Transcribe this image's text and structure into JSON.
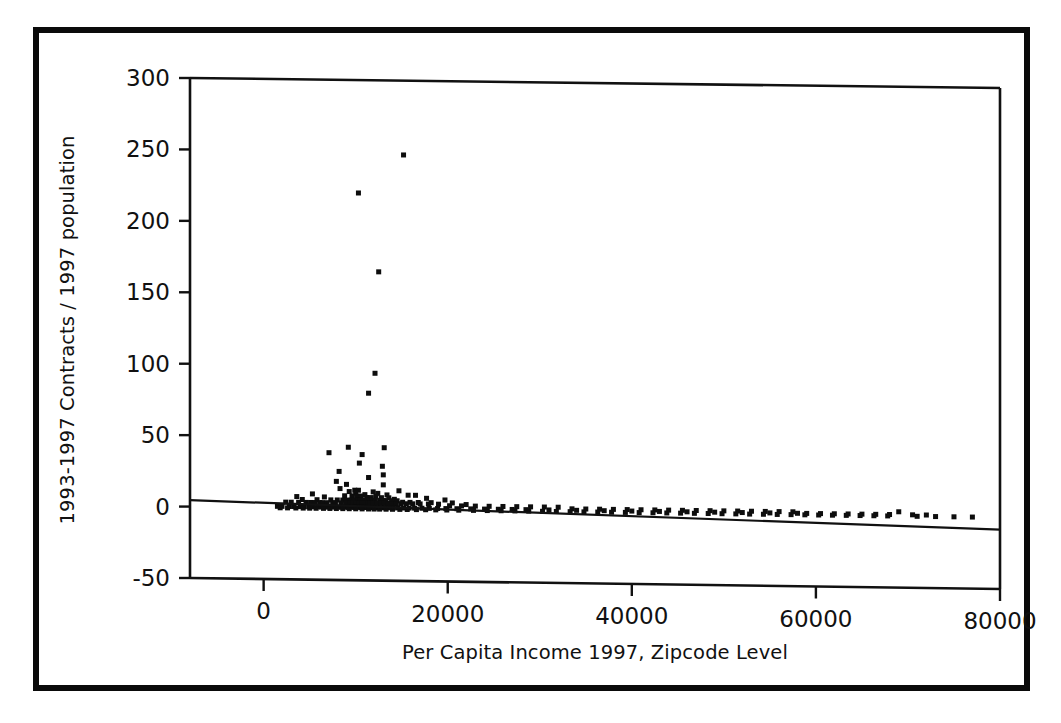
{
  "figure": {
    "name": "scatter-plot-figure",
    "background_color": "#ffffff",
    "frame_color": "#0a0a0a",
    "marker_color": "#0d0d0d"
  },
  "chart_data": {
    "type": "scatter",
    "title": "",
    "xlabel": "Per Capita Income 1997, Zipcode Level",
    "ylabel": "1993-1997 Contracts / 1997 population",
    "xlim": [
      -8000,
      80000
    ],
    "ylim": [
      -50,
      300
    ],
    "xticks": [
      0,
      20000,
      40000,
      60000,
      80000
    ],
    "xtick_labels": [
      "0",
      "20000",
      "40000",
      "60000",
      "80000"
    ],
    "yticks": [
      -50,
      0,
      50,
      100,
      150,
      200,
      250,
      300
    ],
    "ytick_labels": [
      "-50",
      "0",
      "50",
      "100",
      "150",
      "200",
      "250",
      "300"
    ],
    "grid": false,
    "legend": null,
    "series": [
      {
        "name": "Zipcode observations",
        "marker": "square",
        "marker_size": 5,
        "points": [
          [
            15200,
            248
          ],
          [
            10300,
            221
          ],
          [
            12500,
            166
          ],
          [
            12100,
            95
          ],
          [
            11400,
            81
          ],
          [
            13100,
            43
          ],
          [
            9200,
            43
          ],
          [
            7100,
            39
          ],
          [
            10700,
            38
          ],
          [
            10400,
            32
          ],
          [
            12900,
            30
          ],
          [
            8200,
            26
          ],
          [
            13000,
            24
          ],
          [
            11400,
            22
          ],
          [
            7900,
            19
          ],
          [
            9000,
            17
          ],
          [
            13000,
            17
          ],
          [
            8300,
            14
          ],
          [
            9900,
            13
          ],
          [
            10300,
            13
          ],
          [
            14700,
            13
          ],
          [
            9300,
            12
          ],
          [
            11900,
            12
          ],
          [
            12400,
            11
          ],
          [
            10000,
            11
          ],
          [
            5300,
            10
          ],
          [
            11000,
            10
          ],
          [
            13400,
            10
          ],
          [
            15700,
            10
          ],
          [
            16500,
            10
          ],
          [
            3600,
            8
          ],
          [
            6600,
            8
          ],
          [
            8800,
            9
          ],
          [
            9600,
            9
          ],
          [
            10100,
            9
          ],
          [
            10600,
            9
          ],
          [
            11200,
            8
          ],
          [
            11700,
            8
          ],
          [
            12200,
            9
          ],
          [
            12800,
            8
          ],
          [
            13600,
            8
          ],
          [
            14200,
            7
          ],
          [
            17700,
            8
          ],
          [
            19700,
            7
          ],
          [
            4200,
            6
          ],
          [
            5800,
            6
          ],
          [
            7300,
            6
          ],
          [
            8000,
            6
          ],
          [
            8600,
            6
          ],
          [
            9100,
            6
          ],
          [
            9500,
            6
          ],
          [
            9800,
            6
          ],
          [
            10200,
            6
          ],
          [
            10500,
            6
          ],
          [
            10800,
            6
          ],
          [
            11100,
            6
          ],
          [
            11500,
            6
          ],
          [
            11800,
            6
          ],
          [
            12100,
            6
          ],
          [
            12600,
            6
          ],
          [
            13000,
            6
          ],
          [
            13300,
            6
          ],
          [
            13900,
            6
          ],
          [
            14500,
            6
          ],
          [
            15100,
            5
          ],
          [
            15900,
            5
          ],
          [
            16800,
            5
          ],
          [
            18200,
            5
          ],
          [
            20500,
            5
          ],
          [
            22000,
            4
          ],
          [
            2400,
            4
          ],
          [
            3000,
            4
          ],
          [
            3800,
            4
          ],
          [
            4600,
            4
          ],
          [
            5100,
            4
          ],
          [
            5600,
            4
          ],
          [
            6100,
            4
          ],
          [
            6400,
            4
          ],
          [
            6900,
            4
          ],
          [
            7500,
            4
          ],
          [
            7800,
            4
          ],
          [
            8400,
            4
          ],
          [
            8900,
            4
          ],
          [
            9400,
            4
          ],
          [
            9700,
            4
          ],
          [
            10000,
            4
          ],
          [
            10400,
            4
          ],
          [
            10700,
            4
          ],
          [
            11000,
            4
          ],
          [
            11300,
            4
          ],
          [
            11600,
            4
          ],
          [
            11900,
            4
          ],
          [
            12300,
            4
          ],
          [
            12700,
            4
          ],
          [
            13100,
            4
          ],
          [
            13500,
            4
          ],
          [
            14000,
            4
          ],
          [
            14400,
            4
          ],
          [
            14900,
            4
          ],
          [
            15500,
            4
          ],
          [
            16200,
            4
          ],
          [
            17000,
            4
          ],
          [
            17900,
            4
          ],
          [
            19000,
            4
          ],
          [
            20200,
            3
          ],
          [
            21500,
            3
          ],
          [
            23000,
            3
          ],
          [
            24500,
            3
          ],
          [
            26000,
            3
          ],
          [
            27500,
            3
          ],
          [
            29000,
            3
          ],
          [
            30500,
            3
          ],
          [
            32000,
            3
          ],
          [
            33500,
            2
          ],
          [
            35000,
            2
          ],
          [
            36500,
            2
          ],
          [
            38000,
            2
          ],
          [
            39500,
            2
          ],
          [
            41000,
            2
          ],
          [
            42500,
            2
          ],
          [
            44000,
            2
          ],
          [
            45500,
            2
          ],
          [
            47000,
            2
          ],
          [
            48500,
            2
          ],
          [
            50000,
            2
          ],
          [
            51500,
            2
          ],
          [
            53000,
            2
          ],
          [
            54500,
            2
          ],
          [
            56000,
            2
          ],
          [
            57500,
            2
          ],
          [
            59000,
            1
          ],
          [
            60500,
            1
          ],
          [
            62000,
            1
          ],
          [
            63500,
            1
          ],
          [
            65000,
            1
          ],
          [
            66500,
            1
          ],
          [
            68000,
            1
          ],
          [
            69000,
            3
          ],
          [
            70500,
            1
          ],
          [
            72000,
            1
          ],
          [
            1500,
            1
          ],
          [
            2000,
            1
          ],
          [
            2800,
            1
          ],
          [
            3300,
            1
          ],
          [
            4000,
            1
          ],
          [
            4400,
            1
          ],
          [
            4900,
            1
          ],
          [
            5400,
            1
          ],
          [
            5900,
            1
          ],
          [
            6300,
            1
          ],
          [
            6700,
            1
          ],
          [
            7100,
            1
          ],
          [
            7600,
            1
          ],
          [
            8100,
            1
          ],
          [
            8500,
            1
          ],
          [
            8800,
            1
          ],
          [
            9200,
            1
          ],
          [
            9600,
            1
          ],
          [
            9900,
            1
          ],
          [
            10300,
            1
          ],
          [
            10600,
            1
          ],
          [
            10900,
            1
          ],
          [
            11200,
            1
          ],
          [
            11500,
            1
          ],
          [
            11800,
            1
          ],
          [
            12100,
            1
          ],
          [
            12400,
            1
          ],
          [
            12800,
            1
          ],
          [
            13200,
            1
          ],
          [
            13600,
            1
          ],
          [
            14100,
            1
          ],
          [
            14600,
            1
          ],
          [
            15200,
            1
          ],
          [
            15800,
            1
          ],
          [
            16400,
            1
          ],
          [
            17200,
            1
          ],
          [
            18000,
            1
          ],
          [
            18900,
            1
          ],
          [
            19800,
            1
          ],
          [
            21000,
            1
          ],
          [
            22500,
            1
          ],
          [
            24000,
            1
          ],
          [
            25500,
            1
          ],
          [
            27000,
            1
          ],
          [
            28500,
            1
          ],
          [
            31000,
            1
          ],
          [
            34000,
            1
          ],
          [
            37000,
            1
          ],
          [
            40000,
            1
          ],
          [
            43000,
            1
          ],
          [
            46000,
            1
          ],
          [
            49000,
            1
          ],
          [
            52000,
            1
          ],
          [
            55000,
            1
          ],
          [
            58000,
            1
          ],
          [
            1800,
            0
          ],
          [
            2600,
            0
          ],
          [
            3500,
            0
          ],
          [
            4300,
            0
          ],
          [
            5000,
            0
          ],
          [
            5700,
            0
          ],
          [
            6500,
            0
          ],
          [
            7200,
            0
          ],
          [
            7900,
            0
          ],
          [
            8600,
            0
          ],
          [
            9300,
            0
          ],
          [
            10000,
            0
          ],
          [
            10700,
            0
          ],
          [
            11400,
            0
          ],
          [
            12000,
            0
          ],
          [
            12600,
            0
          ],
          [
            13300,
            0
          ],
          [
            14000,
            0
          ],
          [
            14800,
            0
          ],
          [
            15600,
            0
          ],
          [
            16600,
            0
          ],
          [
            17600,
            0
          ],
          [
            18700,
            0
          ],
          [
            19900,
            0
          ],
          [
            21200,
            0
          ],
          [
            22800,
            0
          ],
          [
            24300,
            0
          ],
          [
            25800,
            0
          ],
          [
            27300,
            0
          ],
          [
            28800,
            0
          ],
          [
            30300,
            0
          ],
          [
            31800,
            0
          ],
          [
            33300,
            0
          ],
          [
            34800,
            0
          ],
          [
            36300,
            0
          ],
          [
            37800,
            0
          ],
          [
            39300,
            0
          ],
          [
            40800,
            0
          ],
          [
            42300,
            0
          ],
          [
            43800,
            0
          ],
          [
            45300,
            0
          ],
          [
            46800,
            0
          ],
          [
            48300,
            0
          ],
          [
            49800,
            0
          ],
          [
            51300,
            0
          ],
          [
            52800,
            0
          ],
          [
            54300,
            0
          ],
          [
            55800,
            0
          ],
          [
            57300,
            0
          ],
          [
            58800,
            0
          ],
          [
            60300,
            0
          ],
          [
            61800,
            0
          ],
          [
            63300,
            0
          ],
          [
            64800,
            0
          ],
          [
            66300,
            0
          ],
          [
            67800,
            0
          ],
          [
            71000,
            0
          ],
          [
            73000,
            0
          ],
          [
            75000,
            0
          ],
          [
            77000,
            0
          ]
        ]
      }
    ],
    "trend_line": {
      "name": "linear-fit",
      "x_start": -8000,
      "y_start": 4.5,
      "x_end": 80000,
      "y_end": -8.5
    }
  }
}
